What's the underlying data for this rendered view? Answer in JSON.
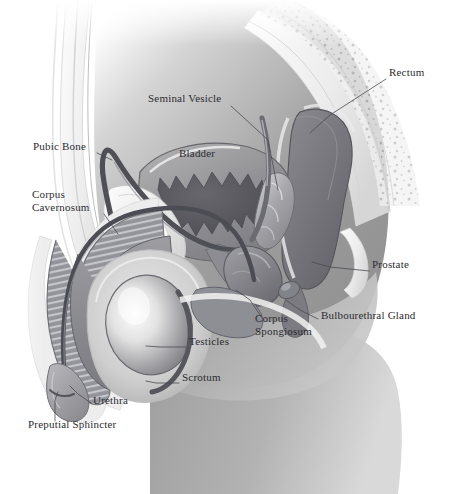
{
  "figure": {
    "width": 456,
    "height": 494,
    "background": "#ffffff",
    "label_color": "#2c2c30",
    "leader_color": "#4a4a52",
    "palette": {
      "skin_light": "#e9e9e9",
      "skin_mid": "#c9c9c9",
      "tissue_mid": "#9b9b9b",
      "tissue_dark": "#6f6f73",
      "organ_dark": "#5d5d62",
      "bladder_lumen": "#55555a",
      "bone_pale": "#efefef",
      "outline": "#6b6b70",
      "highlight": "#f6f6f6"
    }
  },
  "labels": [
    {
      "id": "rectum",
      "text": "Rectum",
      "x": 389,
      "y": 72,
      "align": "left",
      "leader": [
        [
          386,
          79
        ],
        [
          330,
          115
        ],
        [
          310,
          133
        ]
      ]
    },
    {
      "id": "seminal-vesicle",
      "text": "Seminal Vesicle",
      "x": 148,
      "y": 98,
      "align": "left",
      "leader": [
        [
          231,
          106
        ],
        [
          268,
          140
        ],
        [
          278,
          190
        ]
      ]
    },
    {
      "id": "pubic-bone",
      "text": "Pubic Bone",
      "x": 33,
      "y": 146,
      "align": "left",
      "leader": [
        [
          97,
          153
        ],
        [
          112,
          160
        ]
      ]
    },
    {
      "id": "bladder",
      "text": "Bladder",
      "x": 179,
      "y": 153,
      "align": "left",
      "leader": []
    },
    {
      "id": "corpus-cavernosum",
      "text": "Corpus\nCavernosum",
      "x": 32,
      "y": 194,
      "align": "left",
      "leader": [
        [
          104,
          214
        ],
        [
          118,
          234
        ]
      ]
    },
    {
      "id": "prostate",
      "text": "Prostate",
      "x": 372,
      "y": 264,
      "align": "left",
      "leader": [
        [
          369,
          271
        ],
        [
          330,
          267
        ],
        [
          312,
          262
        ]
      ]
    },
    {
      "id": "bulbourethral-gland",
      "text": "Bulbourethral Gland",
      "x": 321,
      "y": 315,
      "align": "left",
      "leader": [
        [
          318,
          319
        ],
        [
          300,
          310
        ],
        [
          286,
          300
        ]
      ]
    },
    {
      "id": "corpus-spongiosum",
      "text": "Corpus\nSpongiosum",
      "x": 255,
      "y": 318,
      "align": "left",
      "leader": [
        [
          262,
          318
        ],
        [
          250,
          300
        ],
        [
          236,
          290
        ]
      ]
    },
    {
      "id": "testicles",
      "text": "Testicles",
      "x": 189,
      "y": 341,
      "align": "left",
      "leader": [
        [
          186,
          347
        ],
        [
          160,
          347
        ],
        [
          146,
          346
        ]
      ]
    },
    {
      "id": "scrotum",
      "text": "Scrotum",
      "x": 182,
      "y": 377,
      "align": "left",
      "leader": [
        [
          179,
          383
        ],
        [
          156,
          383
        ],
        [
          146,
          381
        ]
      ]
    },
    {
      "id": "urethra",
      "text": "Urethra",
      "x": 93,
      "y": 400,
      "align": "left",
      "leader": [
        [
          91,
          403
        ],
        [
          78,
          394
        ],
        [
          70,
          386
        ]
      ]
    },
    {
      "id": "preputial-sphincter",
      "text": "Preputial Sphincter",
      "x": 28,
      "y": 424,
      "align": "left",
      "leader": [
        [
          55,
          421
        ],
        [
          55,
          400
        ],
        [
          58,
          392
        ]
      ]
    }
  ],
  "structures": [
    {
      "id": "abdominal-wall",
      "name": "Abdominal Wall"
    },
    {
      "id": "sacrum",
      "name": "Sacrum / Spine"
    },
    {
      "id": "rectum-organ",
      "name": "Rectum"
    },
    {
      "id": "bladder-organ",
      "name": "Bladder"
    },
    {
      "id": "seminal-vesicle-organ",
      "name": "Seminal Vesicle"
    },
    {
      "id": "prostate-organ",
      "name": "Prostate"
    },
    {
      "id": "bulbourethral-gland-organ",
      "name": "Bulbourethral Gland"
    },
    {
      "id": "vas-deferens",
      "name": "Vas Deferens"
    },
    {
      "id": "penis-shaft",
      "name": "Penis Shaft"
    },
    {
      "id": "corpus-cavernosum-organ",
      "name": "Corpus Cavernosum"
    },
    {
      "id": "corpus-spongiosum-organ",
      "name": "Corpus Spongiosum"
    },
    {
      "id": "urethra-duct",
      "name": "Urethra"
    },
    {
      "id": "testicle-organ",
      "name": "Testicle"
    },
    {
      "id": "scrotum-sac",
      "name": "Scrotum"
    },
    {
      "id": "pubic-bone-organ",
      "name": "Pubic Bone"
    },
    {
      "id": "thigh",
      "name": "Thigh / Buttock"
    }
  ]
}
